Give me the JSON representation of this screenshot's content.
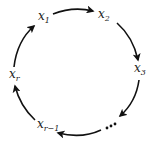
{
  "diagram": {
    "type": "cycle",
    "nodes": [
      {
        "id": "x1",
        "base": "x",
        "sub": "1"
      },
      {
        "id": "x2",
        "base": "x",
        "sub": "2"
      },
      {
        "id": "x3",
        "base": "x",
        "sub": "3"
      },
      {
        "id": "ellipsis",
        "label": "..."
      },
      {
        "id": "xr-1",
        "base": "x",
        "sub": "r−1"
      },
      {
        "id": "xr",
        "base": "x",
        "sub": "r"
      }
    ],
    "edges": [
      {
        "from": "x1",
        "to": "x2"
      },
      {
        "from": "x2",
        "to": "x3"
      },
      {
        "from": "x3",
        "to": "ellipsis"
      },
      {
        "from": "ellipsis",
        "to": "xr-1"
      },
      {
        "from": "xr-1",
        "to": "xr"
      },
      {
        "from": "xr",
        "to": "x1"
      }
    ],
    "colors": {
      "stroke": "#111111",
      "text": "#222222",
      "background": "#ffffff"
    }
  }
}
